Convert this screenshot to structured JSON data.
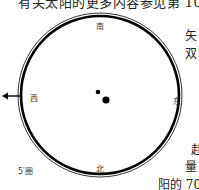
{
  "header": {
    "top_text": "有关太阳的更多内容参见第 103 页"
  },
  "diagram": {
    "directions": {
      "top": "南",
      "bottom": "北",
      "left": "西",
      "right": "东"
    },
    "scale_label": "5′圈",
    "arrow": "left-arrow"
  },
  "side_text": {
    "line1": "矢",
    "line2": "双",
    "line3": "赴",
    "line4": "量",
    "line5": "阳的 70"
  },
  "colors": {
    "ink": "#000000",
    "text": "#333333",
    "background": "#ffffff"
  }
}
